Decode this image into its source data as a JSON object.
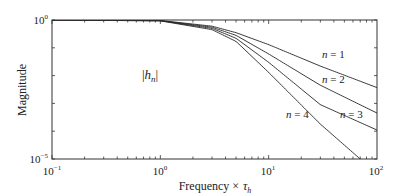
{
  "chart_data": {
    "type": "line",
    "title": "",
    "xlabel": "Frequency × τ_h",
    "xlabel_main": "Frequency ×",
    "xlabel_sym": "τ",
    "xlabel_sub": "h",
    "ylabel": "Magnitude",
    "xscale": "log",
    "yscale": "log",
    "xlim": [
      0.1,
      100
    ],
    "ylim": [
      1e-05,
      1
    ],
    "grid": false,
    "annotation": "|h_n|",
    "x_ticks": [
      {
        "value": 0.1,
        "base": "10",
        "exp": "−1"
      },
      {
        "value": 1,
        "base": "10",
        "exp": "0"
      },
      {
        "value": 10,
        "base": "10",
        "exp": "1"
      },
      {
        "value": 100,
        "base": "10",
        "exp": "2"
      }
    ],
    "y_ticks": [
      {
        "value": 1,
        "base": "10",
        "exp": "0"
      },
      {
        "value": 1e-05,
        "base": "10",
        "exp": "−5"
      }
    ],
    "series": [
      {
        "name": "n = 1",
        "label_n": "n",
        "label_val": "1",
        "order": 1,
        "x": [
          0.1,
          1,
          3,
          5,
          10,
          30,
          100
        ],
        "y": [
          1.0,
          0.96,
          0.6,
          0.35,
          0.13,
          0.022,
          0.0037
        ]
      },
      {
        "name": "n = 2",
        "label_n": "n",
        "label_val": "2",
        "order": 2,
        "x": [
          0.1,
          1,
          3,
          5,
          10,
          30,
          100
        ],
        "y": [
          1.0,
          0.95,
          0.55,
          0.28,
          0.06,
          0.0045,
          0.00045
        ]
      },
      {
        "name": "n = 3",
        "label_n": "n",
        "label_val": "3",
        "order": 3,
        "x": [
          0.1,
          1,
          3,
          5,
          10,
          30,
          100
        ],
        "y": [
          1.0,
          0.94,
          0.5,
          0.22,
          0.03,
          0.0009,
          0.00011
        ]
      },
      {
        "name": "n = 4",
        "label_n": "n",
        "label_val": "4",
        "order": 4,
        "x": [
          0.1,
          1,
          3,
          5,
          10,
          30,
          70
        ],
        "y": [
          1.0,
          0.93,
          0.45,
          0.17,
          0.013,
          0.00018,
          1e-05
        ]
      }
    ]
  }
}
